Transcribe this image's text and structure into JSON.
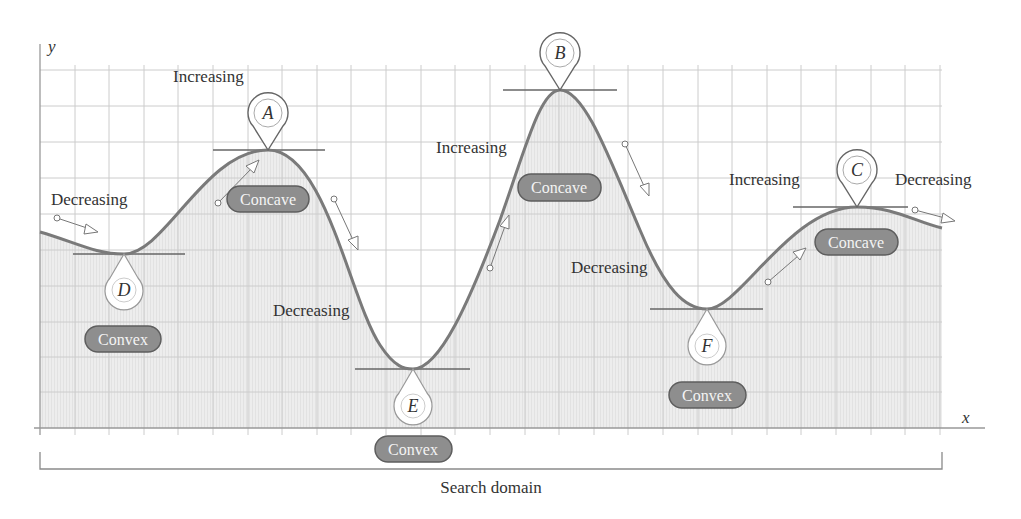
{
  "axes": {
    "x_label": "x",
    "y_label": "y"
  },
  "domain_label": "Search domain",
  "colors": {
    "grid": "#c9c9c9",
    "fill": "#ececec",
    "curve": "#7a7a7a",
    "pill_fill": "#8e8e8e",
    "pill_stroke": "#5e5e5e",
    "text": "#333333"
  },
  "points": [
    {
      "id": "A",
      "type": "local maximum",
      "label": "A",
      "curvature": "Concave"
    },
    {
      "id": "B",
      "type": "global maximum",
      "label": "B",
      "curvature": "Concave"
    },
    {
      "id": "C",
      "type": "local maximum",
      "label": "C",
      "curvature": "Concave"
    },
    {
      "id": "D",
      "type": "local minimum",
      "label": "D",
      "curvature": "Convex"
    },
    {
      "id": "E",
      "type": "global minimum",
      "label": "E",
      "curvature": "Convex"
    },
    {
      "id": "F",
      "type": "local minimum",
      "label": "F",
      "curvature": "Convex"
    }
  ],
  "trend_labels": {
    "t1": "Decreasing",
    "t2": "Increasing",
    "t3": "Decreasing",
    "t4": "Increasing",
    "t5": "Decreasing",
    "t6": "Increasing",
    "t7": "Decreasing"
  },
  "pills": {
    "d": "Convex",
    "a": "Concave",
    "e": "Convex",
    "b": "Concave",
    "f": "Convex",
    "c": "Concave"
  }
}
